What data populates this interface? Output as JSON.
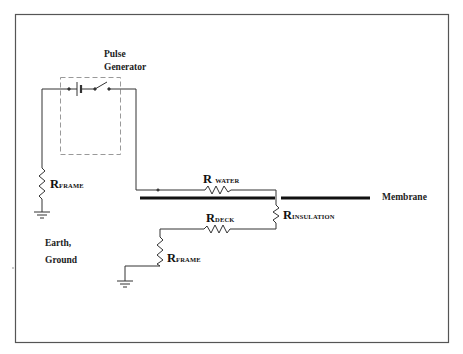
{
  "diagram": {
    "labels": {
      "pulse_generator_line1": "Pulse",
      "pulse_generator_line2": "Generator",
      "membrane": "Membrane",
      "earth_line1": "Earth,",
      "earth_line2": "Ground"
    },
    "resistors": [
      {
        "id": "r_frame_left",
        "symbol": "R",
        "subscript": "FRAME",
        "orientation": "vertical"
      },
      {
        "id": "r_water",
        "symbol": "R",
        "subscript": "WATER",
        "orientation": "horizontal"
      },
      {
        "id": "r_deck",
        "symbol": "R",
        "subscript": "DECK",
        "orientation": "horizontal"
      },
      {
        "id": "r_insulation",
        "symbol": "R",
        "subscript": "INSULATION",
        "orientation": "vertical"
      },
      {
        "id": "r_frame_right",
        "symbol": "R",
        "subscript": "FRAME",
        "orientation": "vertical"
      }
    ],
    "components": [
      "battery",
      "switch",
      "ground-left",
      "ground-right",
      "membrane-line"
    ],
    "colors": {
      "line": "#333333",
      "frame": "#555555",
      "dashed": "#999999",
      "membrane": "#111111"
    }
  }
}
